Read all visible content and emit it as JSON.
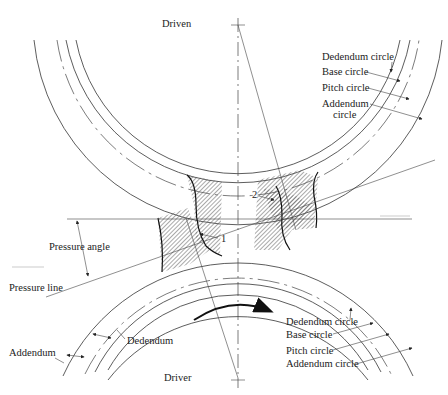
{
  "figure": {
    "title_top": "Driven",
    "title_bottom": "Driver",
    "driven_gear_labels": [
      {
        "label": "Dedendum circle"
      },
      {
        "label": "Base circle"
      },
      {
        "label": "Pitch circle"
      },
      {
        "label": "Addendum",
        "label_line2": "circle"
      }
    ],
    "driver_gear_labels": [
      {
        "label": "Dedendum circle"
      },
      {
        "label": "Base circle"
      },
      {
        "label": "Pitch circle"
      },
      {
        "label": "Addendum circle"
      }
    ],
    "left_labels": {
      "pressure_angle": "Pressure angle",
      "pressure_line": "Pressure line",
      "dedendum": "Dedendum",
      "addendum": "Addendum"
    },
    "contact_points": {
      "point_1": "1",
      "point_2": "2"
    },
    "colors": {
      "line": "#333333",
      "hatch": "#555555",
      "background": "#ffffff"
    }
  }
}
